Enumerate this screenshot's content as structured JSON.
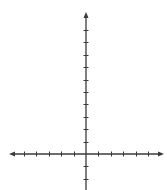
{
  "diagram": {
    "type": "coordinate-plane",
    "title": "",
    "axis_color": "#3a3a3a",
    "background": "#ffffff",
    "origin_px": {
      "x": 86,
      "y": 154
    },
    "tick_spacing_px": 12.4,
    "x_axis": {
      "left_end_px": 9,
      "right_end_px": 164,
      "arrow_left": true,
      "arrow_right": true,
      "ticks_negative": 5,
      "ticks_positive": 5,
      "labels": []
    },
    "y_axis": {
      "top_end_px": 12,
      "bottom_end_px": 190,
      "arrow_top": true,
      "arrow_bottom": false,
      "ticks_positive": 10,
      "ticks_negative": 2,
      "labels": []
    }
  }
}
